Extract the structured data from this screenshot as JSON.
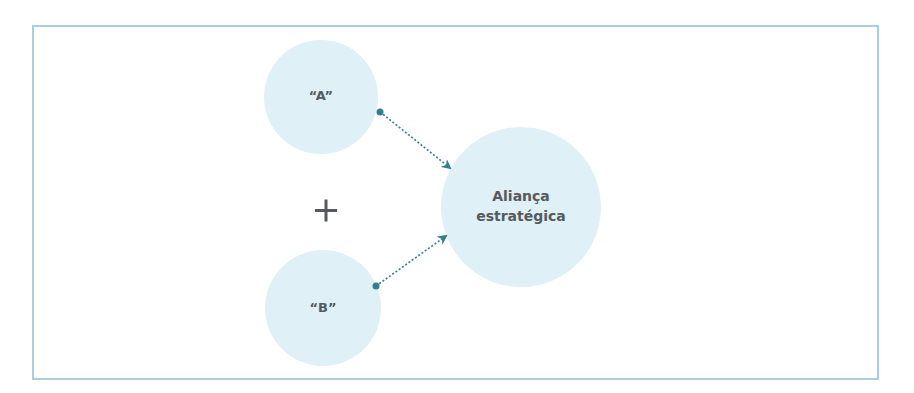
{
  "diagram": {
    "nodes": [
      {
        "id": "A",
        "label": "“A”",
        "cx": 321,
        "cy": 97,
        "r": 57
      },
      {
        "id": "B",
        "label": "“B”",
        "cx": 323,
        "cy": 308,
        "r": 58
      },
      {
        "id": "alliance",
        "label_line1": "Aliança",
        "label_line2": "estratégica",
        "cx": 521,
        "cy": 207,
        "r": 80
      }
    ],
    "operator": "+",
    "edges": [
      {
        "from": "A",
        "to": "alliance",
        "style": "dotted-arrow"
      },
      {
        "from": "B",
        "to": "alliance",
        "style": "dotted-arrow"
      }
    ],
    "colors": {
      "circle_fill": "#dff0f7",
      "arrow": "#2f7f91",
      "text": "#555a5e",
      "frame": "#a9cfdc",
      "plus": "#555a5e"
    }
  }
}
